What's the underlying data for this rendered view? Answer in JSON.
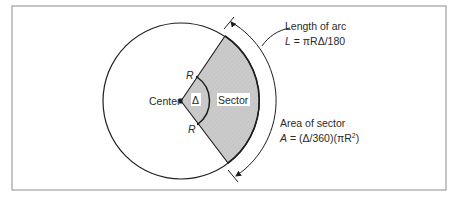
{
  "figure": {
    "frame": {
      "x": 12,
      "y": 6,
      "width": 434,
      "height": 184,
      "stroke": "#8c8c8c"
    },
    "circle": {
      "cx": 181,
      "cy": 101,
      "r": 78,
      "stroke": "#1e1e1e"
    },
    "sector": {
      "fill": "#c9c9c9",
      "start_angle_deg": -50,
      "end_angle_deg": 52
    },
    "labels": {
      "center": "Center",
      "radius_top": "R",
      "radius_bottom": "R",
      "delta": "Δ",
      "sector": "Sector",
      "arc_length_title": "Length of arc",
      "arc_length_formula_var": "L",
      "arc_length_formula_rest": " = πRΔ/180",
      "area_title": "Area of sector",
      "area_formula_var": "A",
      "area_formula_rest": " = (Δ/360)(πR",
      "area_formula_exp": "2",
      "area_formula_close": ")"
    },
    "colors": {
      "line": "#1e1e1e",
      "sector_fill": "#c9c9c9",
      "frame": "#8c8c8c",
      "text": "#2a2a2a"
    }
  }
}
